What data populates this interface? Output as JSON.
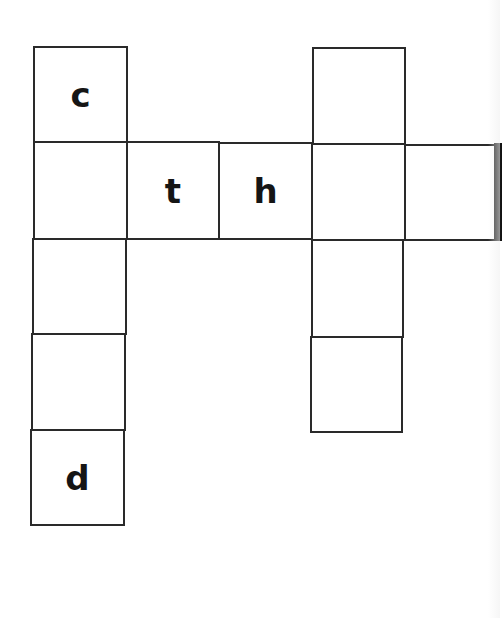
{
  "puzzle": {
    "type": "crossword-grid",
    "cells": [
      {
        "id": "c-col1-r1",
        "x": 33,
        "y": 46,
        "w": 95,
        "h": 97,
        "letter": "c"
      },
      {
        "id": "c-col1-r2",
        "x": 33,
        "y": 141,
        "w": 95,
        "h": 99,
        "letter": ""
      },
      {
        "id": "c-col1-r3",
        "x": 32,
        "y": 238,
        "w": 95,
        "h": 97,
        "letter": ""
      },
      {
        "id": "c-col1-r4",
        "x": 31,
        "y": 333,
        "w": 95,
        "h": 98,
        "letter": ""
      },
      {
        "id": "c-col1-r5",
        "x": 30,
        "y": 429,
        "w": 95,
        "h": 97,
        "letter": "d"
      },
      {
        "id": "c-row-c2",
        "x": 126,
        "y": 141,
        "w": 94,
        "h": 99,
        "letter": "t"
      },
      {
        "id": "c-row-c3",
        "x": 218,
        "y": 142,
        "w": 95,
        "h": 98,
        "letter": "h"
      },
      {
        "id": "c-row-c4",
        "x": 311,
        "y": 143,
        "w": 95,
        "h": 98,
        "letter": ""
      },
      {
        "id": "c-row-c5",
        "x": 404,
        "y": 144,
        "w": 92,
        "h": 97,
        "letter": ""
      },
      {
        "id": "c-col4-r1",
        "x": 312,
        "y": 47,
        "w": 94,
        "h": 98,
        "letter": ""
      },
      {
        "id": "c-col4-r3",
        "x": 311,
        "y": 239,
        "w": 93,
        "h": 99,
        "letter": ""
      },
      {
        "id": "c-col4-r4",
        "x": 310,
        "y": 336,
        "w": 93,
        "h": 97,
        "letter": ""
      }
    ]
  }
}
